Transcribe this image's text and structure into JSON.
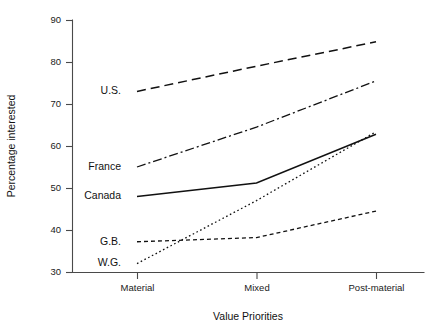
{
  "chart_data": {
    "type": "line",
    "title": "",
    "xlabel": "Value Priorities",
    "ylabel": "Percentage interested",
    "categories": [
      "Material",
      "Mixed",
      "Post-material"
    ],
    "ylim": [
      30,
      90
    ],
    "yticks": [
      30,
      40,
      50,
      60,
      70,
      80,
      90
    ],
    "grid": false,
    "legend_position": "inline-left-labels",
    "series": [
      {
        "name": "U.S.",
        "values": [
          73.0,
          79.0,
          84.8
        ],
        "style": "dashed",
        "label_y": 73.0
      },
      {
        "name": "France",
        "values": [
          55.0,
          64.5,
          75.5
        ],
        "style": "dash-dot",
        "label_y": 55.0
      },
      {
        "name": "Canada",
        "values": [
          48.0,
          51.2,
          62.8
        ],
        "style": "solid",
        "label_y": 48.0
      },
      {
        "name": "G.B.",
        "values": [
          37.2,
          38.2,
          44.5
        ],
        "style": "short-dash",
        "label_y": 37.2
      },
      {
        "name": "W.G.",
        "values": [
          32.0,
          47.0,
          63.4
        ],
        "style": "dotted",
        "label_y": 32.0
      }
    ]
  },
  "axis": {
    "y_tick_labels": [
      "30",
      "40",
      "50",
      "60",
      "70",
      "80",
      "90"
    ],
    "x_tick_labels": [
      "Material",
      "Mixed",
      "Post-material"
    ],
    "y_title": "Percentage interested",
    "x_title": "Value Priorities"
  },
  "series_labels": {
    "us": "U.S.",
    "france": "France",
    "canada": "Canada",
    "gb": "G.B.",
    "wg": "W.G."
  },
  "colors": {
    "ink": "#111111",
    "axis": "#4a4a4a",
    "background": "#ffffff"
  }
}
